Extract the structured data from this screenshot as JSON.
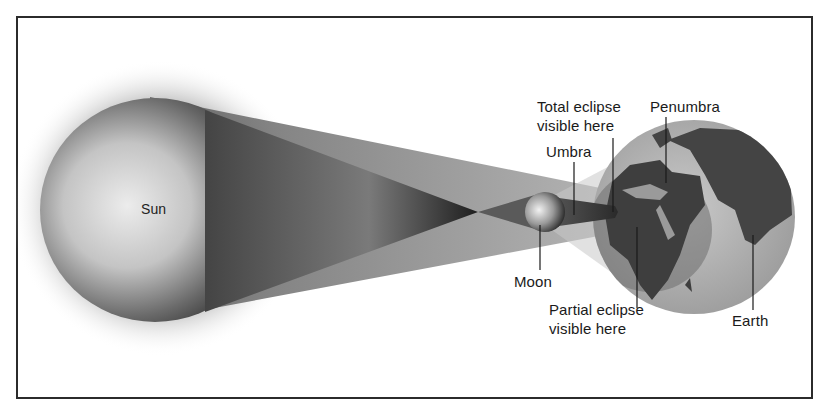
{
  "diagram": {
    "bodies": [
      {
        "name": "Sun",
        "label": "Sun"
      },
      {
        "name": "Moon",
        "label": "Moon"
      },
      {
        "name": "Earth",
        "label": "Earth"
      }
    ],
    "labels": {
      "sun": "Sun",
      "total_eclipse_line1": "Total eclipse",
      "total_eclipse_line2": "visible here",
      "penumbra": "Penumbra",
      "umbra": "Umbra",
      "moon": "Moon",
      "partial_eclipse_line1": "Partial eclipse",
      "partial_eclipse_line2": "visible here",
      "earth": "Earth"
    },
    "colors": {
      "border": "#2b2b2b",
      "sun_light": "#e6e6e6",
      "sun_dark": "#3a3a3a",
      "umbra_cone": "#2e2e2e",
      "penumbra_cone": "#9a9a9a",
      "earth_ocean": "#b8b8b8",
      "earth_land": "#4a4a4a",
      "text": "#1a1a1a"
    }
  }
}
